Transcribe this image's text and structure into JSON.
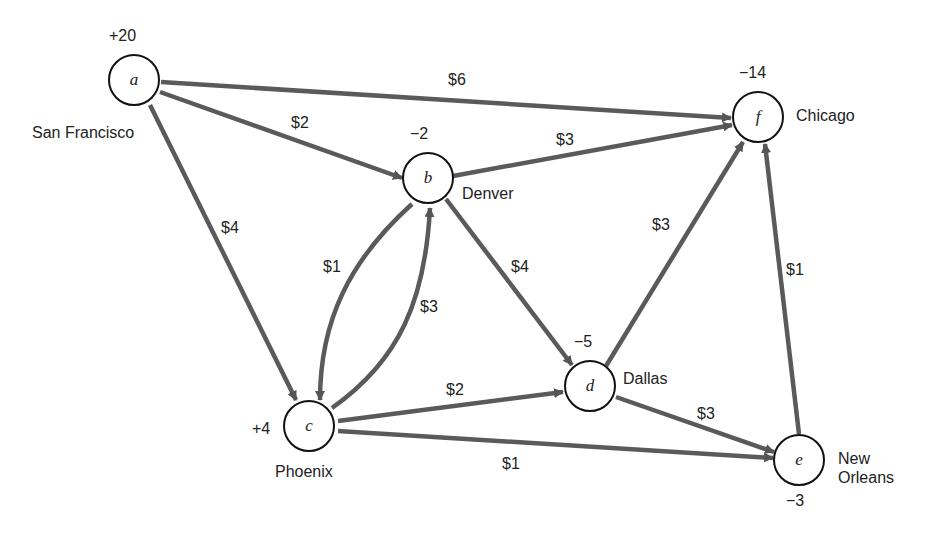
{
  "diagram": {
    "type": "network-flow",
    "nodes": [
      {
        "id": "a",
        "city": "San Francisco",
        "supply": "+20"
      },
      {
        "id": "b",
        "city": "Denver",
        "supply": "−2"
      },
      {
        "id": "c",
        "city": "Phoenix",
        "supply": "+4"
      },
      {
        "id": "d",
        "city": "Dallas",
        "supply": "−5"
      },
      {
        "id": "e",
        "city": "New",
        "city2": "Orleans",
        "supply": "−3"
      },
      {
        "id": "f",
        "city": "Chicago",
        "supply": "−14"
      }
    ],
    "edges": [
      {
        "from": "a",
        "to": "f",
        "cost": "$6"
      },
      {
        "from": "a",
        "to": "b",
        "cost": "$2"
      },
      {
        "from": "a",
        "to": "c",
        "cost": "$4"
      },
      {
        "from": "b",
        "to": "f",
        "cost": "$3"
      },
      {
        "from": "b",
        "to": "c",
        "cost": "$1"
      },
      {
        "from": "c",
        "to": "b",
        "cost": "$3"
      },
      {
        "from": "b",
        "to": "d",
        "cost": "$4"
      },
      {
        "from": "c",
        "to": "d",
        "cost": "$2"
      },
      {
        "from": "c",
        "to": "e",
        "cost": "$1"
      },
      {
        "from": "d",
        "to": "f",
        "cost": "$3"
      },
      {
        "from": "d",
        "to": "e",
        "cost": "$3"
      },
      {
        "from": "e",
        "to": "f",
        "cost": "$1"
      }
    ]
  }
}
